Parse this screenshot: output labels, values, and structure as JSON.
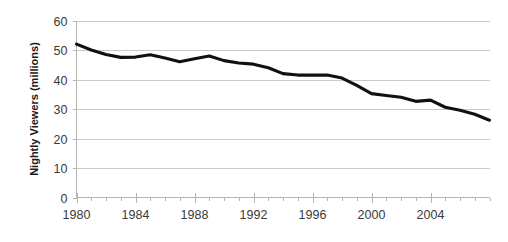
{
  "chart_data": {
    "type": "line",
    "title": "",
    "subtitle": "",
    "xlabel": "",
    "ylabel": "Nightly Viewers (millions)",
    "xlim": [
      1980,
      2006
    ],
    "ylim": [
      0,
      60
    ],
    "grid": true,
    "legend": "none",
    "y_ticks": [
      0,
      10,
      20,
      30,
      40,
      50,
      60
    ],
    "y_tick_labels": [
      "0",
      "10",
      "20",
      "30",
      "40",
      "50",
      "60"
    ],
    "x_ticks": [
      1980,
      1984,
      1988,
      1992,
      1996,
      2000,
      2004
    ],
    "x_tick_labels": [
      "1980",
      "1984",
      "1988",
      "1992",
      "1996",
      "2000",
      "2004"
    ],
    "x_minor_step": 1,
    "line_color": "#111111",
    "gridline_color": "#c9c9c9",
    "axis_color": "#b5b5b5",
    "background_color": "#ffffff",
    "x": [
      1980,
      1981,
      1982,
      1983,
      1984,
      1985,
      1986,
      1987,
      1988,
      1989,
      1990,
      1991,
      1992,
      1993,
      1994,
      1995,
      1996,
      1997,
      1998,
      1999,
      2000,
      2001,
      2002,
      2003,
      2004,
      2005,
      2006
    ],
    "values": [
      52.0,
      50.0,
      48.5,
      47.5,
      47.5,
      48.5,
      47.5,
      46.0,
      47.0,
      48.0,
      46.5,
      45.5,
      45.0,
      44.0,
      42.0,
      41.5,
      41.5,
      41.5,
      40.5,
      38.0,
      35.0,
      34.5,
      34.0,
      32.5,
      33.0,
      30.5,
      29.5
    ],
    "series": [
      {
        "name": "Nightly Viewers",
        "values": [
          52.0,
          50.0,
          48.5,
          47.5,
          47.5,
          48.5,
          47.5,
          46.0,
          47.0,
          48.0,
          46.5,
          45.5,
          45.0,
          44.0,
          42.0,
          41.5,
          41.5,
          41.5,
          40.5,
          38.0,
          35.0,
          34.5,
          34.0,
          32.5,
          33.0,
          30.5,
          29.5
        ]
      }
    ],
    "points": [
      {
        "x": 1980.0,
        "y": 52.0
      },
      {
        "x": 1981.0,
        "y": 50.0
      },
      {
        "x": 1982.0,
        "y": 48.5
      },
      {
        "x": 1983.0,
        "y": 47.5
      },
      {
        "x": 1984.0,
        "y": 47.6
      },
      {
        "x": 1985.0,
        "y": 48.4
      },
      {
        "x": 1986.0,
        "y": 47.3
      },
      {
        "x": 1987.0,
        "y": 46.0
      },
      {
        "x": 1988.0,
        "y": 47.0
      },
      {
        "x": 1989.0,
        "y": 48.0
      },
      {
        "x": 1990.0,
        "y": 46.4
      },
      {
        "x": 1991.0,
        "y": 45.6
      },
      {
        "x": 1992.0,
        "y": 45.2
      },
      {
        "x": 1993.0,
        "y": 44.0
      },
      {
        "x": 1994.0,
        "y": 42.0
      },
      {
        "x": 1995.0,
        "y": 41.5
      },
      {
        "x": 1996.0,
        "y": 41.5
      },
      {
        "x": 1997.0,
        "y": 41.5
      },
      {
        "x": 1998.0,
        "y": 40.5
      },
      {
        "x": 1999.0,
        "y": 38.0
      },
      {
        "x": 2000.0,
        "y": 35.2
      },
      {
        "x": 2001.0,
        "y": 34.6
      },
      {
        "x": 2002.0,
        "y": 34.0
      },
      {
        "x": 2003.0,
        "y": 32.6
      },
      {
        "x": 2004.0,
        "y": 33.0
      },
      {
        "x": 2005.0,
        "y": 30.6
      },
      {
        "x": 2006.0,
        "y": 29.6
      },
      {
        "x": 2007.0,
        "y": 28.2
      },
      {
        "x": 2008.0,
        "y": 26.2
      }
    ]
  }
}
